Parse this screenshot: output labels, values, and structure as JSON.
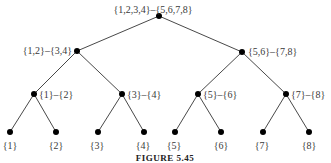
{
  "figure": {
    "caption": "FIGURE 5.45",
    "nodes": [
      {
        "id": "root",
        "label": "{1,2,3,4}–{5,6,7,8}",
        "x": 159,
        "y": 16,
        "lx": 153,
        "ly": 10,
        "anchor": "middle"
      },
      {
        "id": "n12_34",
        "label": "{1,2}–{3,4}",
        "x": 77,
        "y": 51,
        "lx": 72,
        "ly": 51,
        "anchor": "end"
      },
      {
        "id": "n56_78",
        "label": "{5,6}–{7,8}",
        "x": 242,
        "y": 52,
        "lx": 248,
        "ly": 52,
        "anchor": "start"
      },
      {
        "id": "n1_2",
        "label": "{1}–{2}",
        "x": 34,
        "y": 94,
        "lx": 39,
        "ly": 95,
        "anchor": "start"
      },
      {
        "id": "n3_4",
        "label": "{3}–{4}",
        "x": 122,
        "y": 94,
        "lx": 127,
        "ly": 95,
        "anchor": "start"
      },
      {
        "id": "n5_6",
        "label": "{5}–{6}",
        "x": 198,
        "y": 94,
        "lx": 203,
        "ly": 95,
        "anchor": "start"
      },
      {
        "id": "n7_8",
        "label": "{7}–{8}",
        "x": 286,
        "y": 94,
        "lx": 291,
        "ly": 95,
        "anchor": "start"
      },
      {
        "id": "l1",
        "label": "{1}",
        "x": 10,
        "y": 132,
        "lx": 10,
        "ly": 146,
        "anchor": "middle"
      },
      {
        "id": "l2",
        "label": "{2}",
        "x": 56,
        "y": 132,
        "lx": 56,
        "ly": 146,
        "anchor": "middle"
      },
      {
        "id": "l3",
        "label": "{3}",
        "x": 98,
        "y": 132,
        "lx": 97,
        "ly": 146,
        "anchor": "middle"
      },
      {
        "id": "l4",
        "label": "{4}",
        "x": 144,
        "y": 132,
        "lx": 143,
        "ly": 146,
        "anchor": "middle"
      },
      {
        "id": "l5",
        "label": "{5}",
        "x": 175,
        "y": 132,
        "lx": 174,
        "ly": 146,
        "anchor": "middle"
      },
      {
        "id": "l6",
        "label": "{6}",
        "x": 221,
        "y": 132,
        "lx": 221,
        "ly": 146,
        "anchor": "middle"
      },
      {
        "id": "l7",
        "label": "{7}",
        "x": 263,
        "y": 132,
        "lx": 262,
        "ly": 146,
        "anchor": "middle"
      },
      {
        "id": "l8",
        "label": "{8}",
        "x": 309,
        "y": 132,
        "lx": 309,
        "ly": 146,
        "anchor": "middle"
      }
    ],
    "edges": [
      [
        "root",
        "n12_34"
      ],
      [
        "root",
        "n56_78"
      ],
      [
        "n12_34",
        "n1_2"
      ],
      [
        "n12_34",
        "n3_4"
      ],
      [
        "n56_78",
        "n5_6"
      ],
      [
        "n56_78",
        "n7_8"
      ],
      [
        "n1_2",
        "l1"
      ],
      [
        "n1_2",
        "l2"
      ],
      [
        "n3_4",
        "l3"
      ],
      [
        "n3_4",
        "l4"
      ],
      [
        "n5_6",
        "l5"
      ],
      [
        "n5_6",
        "l6"
      ],
      [
        "n7_8",
        "l7"
      ],
      [
        "n7_8",
        "l8"
      ]
    ]
  }
}
